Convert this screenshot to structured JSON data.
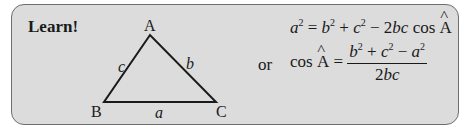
{
  "heading": "Learn!",
  "triangle": {
    "vertices": {
      "A": "A",
      "B": "B",
      "C": "C"
    },
    "sides": {
      "a": "a",
      "b": "b",
      "c": "c"
    }
  },
  "formula1": {
    "lhs_var": "a",
    "lhs_exp": "2",
    "b": "b",
    "b_exp": "2",
    "plus": "+",
    "c": "c",
    "c_exp": "2",
    "minus": "−",
    "coef": "2",
    "bc": "bc",
    "cos": "cos",
    "angle": "A",
    "equals": "="
  },
  "connector": "or",
  "formula2": {
    "cos": "cos",
    "angle": "A",
    "equals": "=",
    "numerator": {
      "b": "b",
      "b_exp": "2",
      "plus": "+",
      "c": "c",
      "c_exp": "2",
      "minus": "−",
      "a": "a",
      "a_exp": "2"
    },
    "denominator": {
      "coef": "2",
      "bc": "bc"
    }
  },
  "colors": {
    "box_bg": "#dcdcdc",
    "box_border": "#6e6e6e",
    "ink": "#1a1a1a"
  }
}
